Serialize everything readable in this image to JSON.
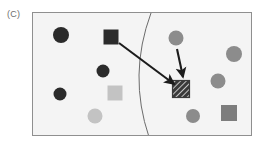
{
  "figure": {
    "panel_label": "(C)",
    "caption_text": "(C)",
    "background_color": "#ffffff"
  },
  "scene": {
    "box": {
      "x": 32,
      "y": 12,
      "width": 220,
      "height": 124,
      "fill_color": "#f4f4f4",
      "border_color": "#8f8f8f"
    },
    "boundary_curve": {
      "name": "decision-boundary-curve",
      "color": "#6b6b6b",
      "stroke_width": 1,
      "start": [
        118,
        0
      ],
      "control": [
        95,
        62
      ],
      "end": [
        116,
        124
      ]
    },
    "shapes": [
      {
        "id": "circle-dark-1",
        "type": "circle",
        "cx": 28,
        "cy": 22,
        "r": 8,
        "color": "#2b2b2b",
        "label": "dark-circle"
      },
      {
        "id": "circle-dark-2",
        "type": "circle",
        "cx": 70,
        "cy": 58,
        "r": 6.5,
        "color": "#2b2b2b",
        "label": "dark-circle"
      },
      {
        "id": "circle-dark-3",
        "type": "circle",
        "cx": 27,
        "cy": 81,
        "r": 6.5,
        "color": "#2b2b2b",
        "label": "dark-circle"
      },
      {
        "id": "square-dark-1",
        "type": "square",
        "cx": 78,
        "cy": 24,
        "size": 15,
        "color": "#2b2b2b",
        "label": "dark-square"
      },
      {
        "id": "square-light-1",
        "type": "square",
        "cx": 82,
        "cy": 80,
        "size": 15,
        "color": "#c3c3c3",
        "label": "light-gray-square"
      },
      {
        "id": "circle-light-1",
        "type": "circle",
        "cx": 62,
        "cy": 103,
        "r": 7.5,
        "color": "#c3c3c3",
        "label": "light-gray-circle"
      },
      {
        "id": "circle-gray-1",
        "type": "circle",
        "cx": 143,
        "cy": 25,
        "r": 7.5,
        "color": "#8c8c8c",
        "label": "gray-circle"
      },
      {
        "id": "circle-gray-2",
        "type": "circle",
        "cx": 201,
        "cy": 41,
        "r": 8,
        "color": "#8c8c8c",
        "label": "gray-circle"
      },
      {
        "id": "circle-gray-3",
        "type": "circle",
        "cx": 185,
        "cy": 68,
        "r": 7.5,
        "color": "#8c8c8c",
        "label": "gray-circle"
      },
      {
        "id": "circle-gray-4",
        "type": "circle",
        "cx": 160,
        "cy": 103,
        "r": 7,
        "color": "#8c8c8c",
        "label": "gray-circle"
      },
      {
        "id": "square-gray-1",
        "type": "square",
        "cx": 196,
        "cy": 100,
        "size": 16,
        "color": "#7d7d7d",
        "label": "gray-square"
      },
      {
        "id": "square-hatched",
        "type": "hatched-square",
        "cx": 148,
        "cy": 76,
        "size": 17,
        "color": "#3a3a3a",
        "label": "hatched-query-square"
      }
    ],
    "arrows": [
      {
        "id": "arrow-long",
        "name": "arrow-from-dark-square",
        "from": [
          86,
          30
        ],
        "to": [
          142,
          72
        ],
        "color": "#1c1c1c",
        "stroke_width": 2.1
      },
      {
        "id": "arrow-short",
        "name": "arrow-from-gray-circle",
        "from": [
          144,
          36
        ],
        "to": [
          150,
          66
        ],
        "color": "#1c1c1c",
        "stroke_width": 2.1
      }
    ]
  }
}
